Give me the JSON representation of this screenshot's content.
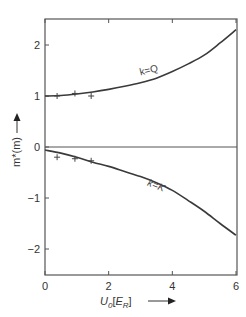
{
  "chart_data": {
    "type": "line",
    "title": "",
    "xlabel": "U0[E_R]",
    "xlabel_main": "U",
    "xlabel_sub": "0",
    "xlabel_unit_open": "[",
    "xlabel_unit_main": "E",
    "xlabel_unit_sub": "R",
    "xlabel_unit_close": "]",
    "ylabel": "m*(m)",
    "xlim": [
      0,
      6
    ],
    "ylim": [
      -2.5,
      2.5
    ],
    "xticks": [
      0,
      2,
      4,
      6
    ],
    "xtick_labels": [
      "0",
      "2",
      "4",
      "6"
    ],
    "yticks": [
      -2,
      -1,
      0,
      1,
      2
    ],
    "ytick_labels": [
      "−2",
      "−1",
      "0",
      "1",
      "2"
    ],
    "grid": false,
    "legend": "none",
    "series": [
      {
        "name": "k=Q",
        "style": "line",
        "x": [
          0,
          0.5,
          1.0,
          1.5,
          2.0,
          2.5,
          3.0,
          3.5,
          4.0,
          4.5,
          5.0,
          5.5,
          6.0
        ],
        "y": [
          1.0,
          1.01,
          1.04,
          1.08,
          1.13,
          1.19,
          1.26,
          1.35,
          1.48,
          1.63,
          1.8,
          2.04,
          2.3
        ]
      },
      {
        "name": "k=K",
        "style": "line",
        "x": [
          0,
          0.5,
          1.0,
          1.5,
          2.0,
          2.5,
          3.0,
          3.5,
          4.0,
          4.5,
          5.0,
          5.5,
          6.0
        ],
        "y": [
          -0.06,
          -0.12,
          -0.2,
          -0.3,
          -0.38,
          -0.48,
          -0.58,
          -0.7,
          -0.85,
          -1.05,
          -1.26,
          -1.5,
          -1.73
        ]
      },
      {
        "name": "k=Q data",
        "style": "markers",
        "marker": "+",
        "x": [
          0.38,
          0.94,
          1.45
        ],
        "y": [
          1.0,
          1.05,
          1.0
        ]
      },
      {
        "name": "k=K data",
        "style": "markers",
        "marker": "+",
        "x": [
          0.38,
          0.94,
          1.45
        ],
        "y": [
          -0.2,
          -0.23,
          -0.27
        ]
      }
    ],
    "reference_lines": [
      {
        "axis": "y",
        "value": 0
      }
    ],
    "annotations": [
      {
        "text": "k=Q",
        "x": 3.0,
        "y": 1.4
      },
      {
        "text": "k=K",
        "x": 3.2,
        "y": -0.75
      }
    ]
  }
}
